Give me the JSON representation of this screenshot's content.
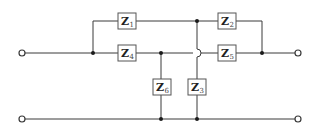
{
  "diagram": {
    "type": "two-port impedance network",
    "colors": {
      "wire": "#3a3a3a",
      "box_border": "#555555",
      "text": "#222222",
      "background": "#ffffff"
    },
    "terminals": [
      {
        "id": "in-top",
        "x": 22,
        "y": 53
      },
      {
        "id": "in-bottom",
        "x": 22,
        "y": 119
      },
      {
        "id": "out-top",
        "x": 298,
        "y": 53
      },
      {
        "id": "out-bottom",
        "x": 298,
        "y": 119
      }
    ],
    "impedances": [
      {
        "id": "Z1",
        "symbol": "Z",
        "subscript": "1",
        "x": 118,
        "y": 13,
        "w": 18,
        "h": 16,
        "orientation": "horizontal"
      },
      {
        "id": "Z2",
        "symbol": "Z",
        "subscript": "2",
        "x": 218,
        "y": 13,
        "w": 18,
        "h": 16,
        "orientation": "horizontal"
      },
      {
        "id": "Z3",
        "symbol": "Z",
        "subscript": "3",
        "x": 188,
        "y": 79,
        "w": 18,
        "h": 16,
        "orientation": "vertical"
      },
      {
        "id": "Z4",
        "symbol": "Z",
        "subscript": "4",
        "x": 118,
        "y": 45,
        "w": 18,
        "h": 16,
        "orientation": "horizontal"
      },
      {
        "id": "Z5",
        "symbol": "Z",
        "subscript": "5",
        "x": 218,
        "y": 45,
        "w": 18,
        "h": 16,
        "orientation": "horizontal"
      },
      {
        "id": "Z6",
        "symbol": "Z",
        "subscript": "6",
        "x": 153,
        "y": 79,
        "w": 18,
        "h": 16,
        "orientation": "vertical"
      }
    ],
    "junctions": [
      {
        "x": 93,
        "y": 53
      },
      {
        "x": 161,
        "y": 53
      },
      {
        "x": 197,
        "y": 21
      },
      {
        "x": 262,
        "y": 53
      },
      {
        "x": 161,
        "y": 119
      },
      {
        "x": 197,
        "y": 119
      }
    ],
    "crossover": {
      "x": 197,
      "y": 53,
      "style": "hop"
    }
  }
}
